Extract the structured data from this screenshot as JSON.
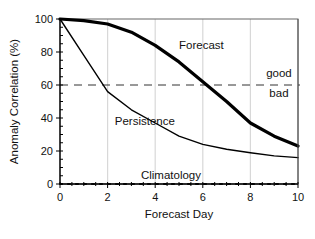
{
  "chart_data": {
    "type": "line",
    "title": "",
    "xlabel": "Forecast Day",
    "ylabel": "Anomaly Correlation (%)",
    "x": [
      0,
      1,
      2,
      3,
      4,
      5,
      6,
      7,
      8,
      9,
      10
    ],
    "xlim": [
      0,
      10
    ],
    "ylim": [
      0,
      100
    ],
    "x_ticks": [
      0,
      2,
      4,
      6,
      8,
      10
    ],
    "y_ticks": [
      0,
      20,
      40,
      60,
      80,
      100
    ],
    "x_tick_labels": [
      "0",
      "2",
      "4",
      "6",
      "8",
      "10"
    ],
    "y_tick_labels": [
      "0",
      "20",
      "40",
      "60",
      "80",
      "100"
    ],
    "grid": "vertical light gray at x = 2, 4, 6, 8",
    "legend": "none (inline curve labels)",
    "series": [
      {
        "name": "Forecast",
        "style": "thick solid",
        "values": [
          100,
          99,
          97,
          92,
          84,
          74,
          62,
          50,
          37,
          29,
          23
        ]
      },
      {
        "name": "Persistence",
        "style": "thin solid",
        "values": [
          100,
          78,
          56,
          45,
          37,
          29,
          24,
          21,
          19,
          17,
          16
        ]
      },
      {
        "name": "Climatology",
        "style": "dotted",
        "values": [
          0,
          0,
          0,
          0,
          0,
          0,
          0,
          0,
          0,
          0,
          0
        ]
      }
    ],
    "threshold": {
      "value": 60,
      "style": "dashed",
      "label_above": "good",
      "label_below": "bad"
    },
    "annotations": [
      {
        "text": "Forecast",
        "x": 5.0,
        "y": 82
      },
      {
        "text": "Persistence",
        "x": 2.3,
        "y": 36
      },
      {
        "text": "Climatology",
        "x": 3.4,
        "y": 3
      },
      {
        "text": "good",
        "x": 9.2,
        "y": 65
      },
      {
        "text": "bad",
        "x": 9.2,
        "y": 53
      }
    ]
  }
}
